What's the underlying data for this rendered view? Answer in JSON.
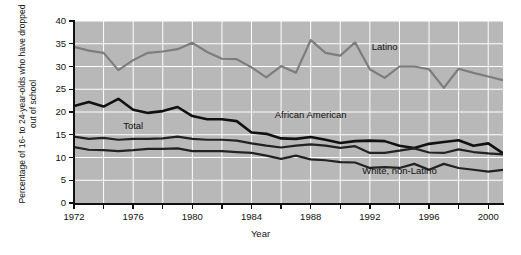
{
  "chart_data": {
    "type": "line",
    "title": "",
    "xlabel": "Year",
    "ylabel": "Percentage of 16- to 24-year-olds who have dropped out of school",
    "xlim": [
      1972,
      2001
    ],
    "ylim": [
      0,
      40
    ],
    "ytick_values": [
      0,
      5,
      10,
      15,
      20,
      25,
      30,
      35,
      40
    ],
    "ytick_labels": [
      "0",
      "5",
      "10",
      "15",
      "20",
      "25",
      "30",
      "35",
      "40"
    ],
    "xtick_values": [
      1972,
      1974,
      1976,
      1978,
      1980,
      1982,
      1984,
      1986,
      1988,
      1990,
      1992,
      1994,
      1996,
      1998,
      2000
    ],
    "xtick_labels": [
      "1972",
      "",
      "1976",
      "",
      "1980",
      "",
      "1984",
      "",
      "1988",
      "",
      "1992",
      "",
      "1996",
      "",
      "2000"
    ],
    "xtick_labels_shown": [
      "1972",
      "1976",
      "1980",
      "1984",
      "1988",
      "1992",
      "1996",
      "2000"
    ],
    "grid": true,
    "grid_color": "#ffffff",
    "plot_background": "#b8b8b8",
    "legend_position": "inline-annotations",
    "x": [
      1972,
      1973,
      1974,
      1975,
      1976,
      1977,
      1978,
      1979,
      1980,
      1981,
      1982,
      1983,
      1984,
      1985,
      1986,
      1987,
      1988,
      1989,
      1990,
      1991,
      1992,
      1993,
      1994,
      1995,
      1996,
      1997,
      1998,
      1999,
      2000,
      2001
    ],
    "series": [
      {
        "name": "Latino",
        "color": "#7d7d7d",
        "label_x": 1993,
        "label_y": 34.2,
        "values": [
          34.3,
          33.5,
          33.0,
          29.2,
          31.4,
          33.0,
          33.3,
          33.8,
          35.2,
          33.2,
          31.7,
          31.6,
          29.8,
          27.6,
          30.1,
          28.6,
          35.8,
          33.0,
          32.4,
          35.3,
          29.4,
          27.5,
          30.0,
          30.0,
          29.4,
          25.3,
          29.5,
          28.6,
          27.8,
          27.0
        ]
      },
      {
        "name": "African American",
        "color": "#111111",
        "label_x": 1988,
        "label_y": 19.3,
        "values": [
          21.3,
          22.2,
          21.2,
          22.9,
          20.5,
          19.8,
          20.2,
          21.1,
          19.1,
          18.4,
          18.4,
          18.0,
          15.5,
          15.2,
          14.2,
          14.1,
          14.5,
          13.9,
          13.2,
          13.6,
          13.7,
          13.6,
          12.6,
          12.1,
          13.0,
          13.4,
          13.8,
          12.6,
          13.1,
          10.9
        ]
      },
      {
        "name": "Total",
        "color": "#222222",
        "label_x": 1976,
        "label_y": 16.9,
        "values": [
          14.6,
          14.1,
          14.3,
          13.9,
          14.1,
          14.1,
          14.2,
          14.6,
          14.1,
          13.9,
          13.9,
          13.7,
          13.1,
          12.6,
          12.2,
          12.6,
          12.9,
          12.6,
          12.1,
          12.5,
          11.0,
          11.0,
          11.5,
          12.0,
          11.1,
          11.0,
          11.8,
          11.2,
          10.9,
          10.7
        ]
      },
      {
        "name": "White, non-Latino",
        "color": "#222222",
        "label_x": 1994,
        "label_y": 7.1,
        "values": [
          12.3,
          11.7,
          11.6,
          11.4,
          11.6,
          11.9,
          11.9,
          12.0,
          11.4,
          11.4,
          11.4,
          11.2,
          11.0,
          10.4,
          9.7,
          10.4,
          9.6,
          9.4,
          9.0,
          8.9,
          7.7,
          7.9,
          7.7,
          8.6,
          7.3,
          8.6,
          7.7,
          7.3,
          6.9,
          7.3
        ]
      }
    ]
  }
}
